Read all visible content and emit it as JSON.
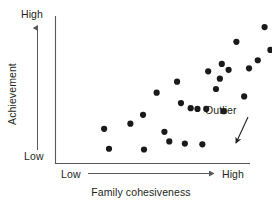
{
  "figure": {
    "background_color": "#ffffff",
    "ink_color": "#231f20",
    "axis_color": "#58595b",
    "point_color": "#1a1a1a",
    "width": 272,
    "height": 208
  },
  "axes": {
    "y": {
      "title": "Achievement",
      "low_label": "Low",
      "high_label": "High",
      "has_direction_arrow": true
    },
    "x": {
      "title": "Family cohesiveness",
      "low_label": "Low",
      "high_label": "High",
      "has_direction_arrow": true
    }
  },
  "annotations": [
    {
      "name": "outlier",
      "label": "Outlier",
      "points_to": {
        "x": 232,
        "y": 149
      }
    }
  ],
  "chart_data": {
    "type": "scatter",
    "title": "",
    "xlabel": "Family cohesiveness",
    "ylabel": "Achievement",
    "xlim": [
      0,
      100
    ],
    "ylim": [
      0,
      100
    ],
    "xtick_labels": [
      "Low",
      "High"
    ],
    "ytick_labels": [
      "Low",
      "High"
    ],
    "grid": false,
    "legend": null,
    "annotations": [
      "Outlier"
    ],
    "series": [
      {
        "name": "Students",
        "points": [
          [
            25.0,
            23.5
          ],
          [
            27.5,
            10.0
          ],
          [
            38.5,
            27.0
          ],
          [
            45.0,
            33.0
          ],
          [
            45.5,
            9.5
          ],
          [
            52.0,
            48.0
          ],
          [
            56.0,
            21.5
          ],
          [
            58.5,
            15.0
          ],
          [
            62.5,
            55.5
          ],
          [
            64.5,
            41.0
          ],
          [
            66.5,
            13.5
          ],
          [
            69.5,
            37.5
          ],
          [
            73.0,
            37.0
          ],
          [
            75.5,
            13.0
          ],
          [
            77.5,
            37.0
          ],
          [
            78.5,
            62.5
          ],
          [
            82.5,
            50.5
          ],
          [
            84.5,
            57.5
          ],
          [
            85.5,
            67.5
          ],
          [
            86.5,
            35.5
          ],
          [
            89.0,
            63.5
          ],
          [
            93.0,
            82.5
          ],
          [
            97.0,
            45.5
          ],
          [
            99.5,
            64.5
          ],
          [
            104.0,
            70.0
          ],
          [
            107.5,
            92.5
          ],
          [
            110.5,
            77.0
          ],
          [
            114.0,
            98.5
          ],
          [
            118.0,
            2.0
          ]
        ]
      }
    ],
    "outlier_point": [
      118.0,
      2.0
    ]
  }
}
